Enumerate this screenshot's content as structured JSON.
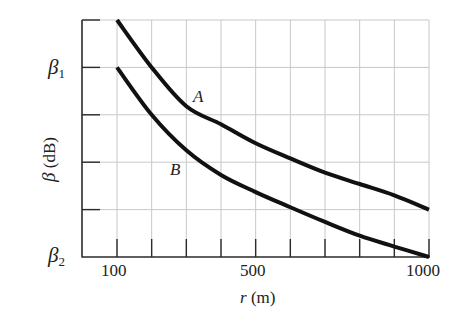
{
  "chart_data": {
    "type": "line",
    "title": "",
    "xlabel": "r (m)",
    "ylabel": "β (dB)",
    "xlim": [
      0,
      1000
    ],
    "ylim": [
      0,
      5
    ],
    "y_unit_note": "y in gridline units above β2 (β2 = 0, β1 = 4)",
    "grid": true,
    "x_tick_labels": [
      {
        "value": 100,
        "label": "100"
      },
      {
        "value": 500,
        "label": "500"
      },
      {
        "value": 1000,
        "label": "1000"
      }
    ],
    "x_ticks": [
      100,
      200,
      300,
      400,
      500,
      600,
      700,
      800,
      900,
      1000
    ],
    "y_tick_labels": [
      {
        "value": 4,
        "label": "β1",
        "base": "β",
        "sub": "1"
      },
      {
        "value": 0,
        "label": "β2",
        "base": "β",
        "sub": "2"
      }
    ],
    "y_ticks": [
      1,
      2,
      3,
      4,
      5
    ],
    "x": [
      100,
      200,
      300,
      400,
      500,
      600,
      700,
      800,
      900,
      1000
    ],
    "series": [
      {
        "name": "A",
        "values": [
          5.0,
          4.0,
          3.18,
          2.8,
          2.4,
          2.08,
          1.78,
          1.54,
          1.3,
          1.0
        ]
      },
      {
        "name": "B",
        "values": [
          4.0,
          3.0,
          2.25,
          1.73,
          1.37,
          1.05,
          0.74,
          0.45,
          0.22,
          0.0
        ]
      }
    ],
    "annotations": [
      {
        "text": "A",
        "x": 290,
        "y": 3.0
      },
      {
        "text": "B",
        "x": 280,
        "y": 1.62
      }
    ],
    "legend": "none (curves labeled directly)"
  },
  "labels": {
    "beta1_base": "β",
    "beta1_sub": "1",
    "beta2_base": "β",
    "beta2_sub": "2",
    "ylabel_symbol": "β",
    "ylabel_unit": " (dB)",
    "xlabel_symbol": "r",
    "xlabel_unit": " (m)",
    "x100": "100",
    "x500": "500",
    "x1000": "1000",
    "curveA": "A",
    "curveB": "B"
  }
}
